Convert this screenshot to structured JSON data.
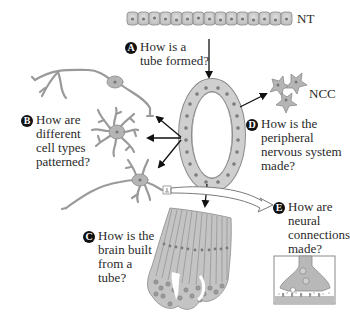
{
  "labels": {
    "nt": "NT",
    "ncc": "NCC"
  },
  "questions": {
    "a": {
      "badge": "A",
      "lines": [
        "How is a",
        "tube formed?"
      ]
    },
    "b": {
      "badge": "B",
      "lines": [
        "How are",
        "different",
        "cell types",
        "patterned?"
      ]
    },
    "c": {
      "badge": "C",
      "lines": [
        "How is the",
        "brain built",
        "from a",
        "tube?"
      ]
    },
    "d": {
      "badge": "D",
      "lines": [
        "How is the",
        "peripheral",
        "nervous system",
        "made?"
      ]
    },
    "e": {
      "badge": "E",
      "lines": [
        "How are",
        "neural",
        "connections",
        "made?"
      ]
    }
  },
  "colors": {
    "cell_fill": "#c9c9c9",
    "cell_stroke": "#8a8a8a",
    "nucleus": "#7a7a7a",
    "neuron_fill": "#b8b8b8",
    "arrow": "#111111"
  }
}
